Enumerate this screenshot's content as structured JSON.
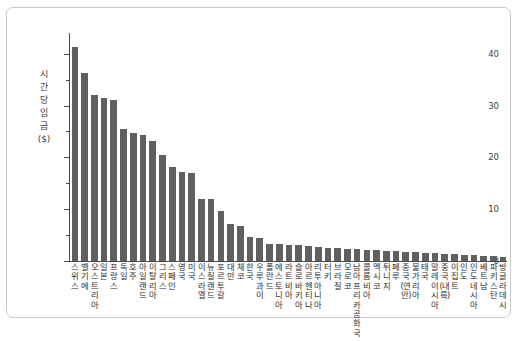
{
  "chart_data": {
    "type": "bar",
    "title": "",
    "xlabel": "",
    "ylabel": "시간당 임금($)",
    "ylim": [
      0,
      44
    ],
    "yticks": [
      0,
      10,
      20,
      30,
      40
    ],
    "ytick_labels": [
      "0",
      "10",
      "20",
      "30",
      "40"
    ],
    "yminor_ticks": [
      5,
      15,
      25,
      35
    ],
    "grid": false,
    "legend": null,
    "bar_color": "#606060",
    "categories": [
      "스위스",
      "벨기에",
      "오스트리아",
      "일본",
      "프랑스",
      "독일",
      "호주",
      "아일랜드",
      "이탈리아",
      "그리스",
      "스페인",
      "영국",
      "미국",
      "이스라엘",
      "뉴질랜드",
      "포르투갈",
      "대만",
      "체코",
      "한국",
      "우루과이",
      "폴란드",
      "에스토니아",
      "라트비아",
      "슬로바키아",
      "아르헨티나",
      "리투아니아",
      "터키",
      "브라질",
      "모로코",
      "남아프리카공화국",
      "콜롬비아",
      "멕시코",
      "튀니지",
      "페루",
      "중국(연안)",
      "불가리아",
      "태국",
      "말레이시아",
      "중국(내륙)",
      "이집트",
      "인도",
      "인도네시아",
      "베트남",
      "파키스탄",
      "방글라데시"
    ],
    "values": [
      41.3,
      36.2,
      32.0,
      31.5,
      31.0,
      25.5,
      24.7,
      24.4,
      23.2,
      20.5,
      18.2,
      17.2,
      17.0,
      12.0,
      11.9,
      9.6,
      7.1,
      6.8,
      4.7,
      4.5,
      3.2,
      3.2,
      3.1,
      3.0,
      2.9,
      2.7,
      2.6,
      2.5,
      2.4,
      2.3,
      2.2,
      2.1,
      2.0,
      1.9,
      1.8,
      1.7,
      1.6,
      1.5,
      1.4,
      1.3,
      1.2,
      1.1,
      1.0,
      0.9,
      0.8
    ]
  }
}
